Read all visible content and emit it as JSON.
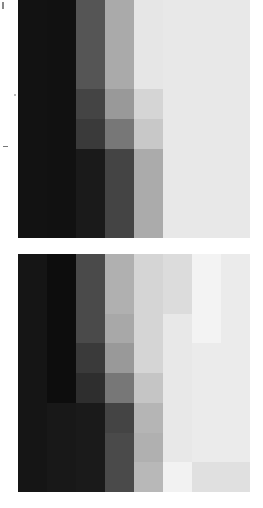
{
  "chart_data": [
    {
      "type": "heatmap",
      "title": "",
      "xlabel": "",
      "ylabel": "",
      "rows": 8,
      "cols": 8,
      "colormap": "grayscale",
      "values": [
        [
          "#121212",
          "#111111",
          "#555555",
          "#aaaaaa",
          "#e6e6e6",
          "#e8e8e8",
          "#e8e8e8",
          "#e8e8e8"
        ],
        [
          "#121212",
          "#111111",
          "#555555",
          "#aaaaaa",
          "#e6e6e6",
          "#e8e8e8",
          "#e8e8e8",
          "#e8e8e8"
        ],
        [
          "#121212",
          "#111111",
          "#555555",
          "#aaaaaa",
          "#e6e6e6",
          "#e8e8e8",
          "#e8e8e8",
          "#e8e8e8"
        ],
        [
          "#121212",
          "#111111",
          "#444444",
          "#999999",
          "#d5d5d5",
          "#e8e8e8",
          "#e8e8e8",
          "#e8e8e8"
        ],
        [
          "#121212",
          "#111111",
          "#3a3a3a",
          "#777777",
          "#c8c8c8",
          "#e8e8e8",
          "#e8e8e8",
          "#e8e8e8"
        ],
        [
          "#121212",
          "#111111",
          "#1a1a1a",
          "#444444",
          "#ababab",
          "#e8e8e8",
          "#e8e8e8",
          "#e8e8e8"
        ],
        [
          "#121212",
          "#111111",
          "#1a1a1a",
          "#444444",
          "#ababab",
          "#e8e8e8",
          "#e8e8e8",
          "#e8e8e8"
        ],
        [
          "#121212",
          "#111111",
          "#1a1a1a",
          "#444444",
          "#ababab",
          "#e8e8e8",
          "#e8e8e8",
          "#e8e8e8"
        ]
      ]
    },
    {
      "type": "heatmap",
      "title": "",
      "xlabel": "",
      "ylabel": "",
      "rows": 8,
      "cols": 8,
      "colormap": "grayscale",
      "values": [
        [
          "#151515",
          "#0d0d0d",
          "#4a4a4a",
          "#b0b0b0",
          "#d5d5d5",
          "#dcdcdc",
          "#f3f3f3",
          "#ebebeb"
        ],
        [
          "#151515",
          "#0d0d0d",
          "#4a4a4a",
          "#b0b0b0",
          "#d5d5d5",
          "#dcdcdc",
          "#f3f3f3",
          "#ebebeb"
        ],
        [
          "#151515",
          "#0d0d0d",
          "#4a4a4a",
          "#a8a8a8",
          "#d5d5d5",
          "#e8e8e8",
          "#f3f3f3",
          "#ebebeb"
        ],
        [
          "#151515",
          "#0d0d0d",
          "#3a3a3a",
          "#999999",
          "#d5d5d5",
          "#e8e8e8",
          "#ebebeb",
          "#ebebeb"
        ],
        [
          "#151515",
          "#0d0d0d",
          "#2e2e2e",
          "#777777",
          "#c5c5c5",
          "#e8e8e8",
          "#ebebeb",
          "#ebebeb"
        ],
        [
          "#151515",
          "#181818",
          "#1a1a1a",
          "#444444",
          "#b5b5b5",
          "#e8e8e8",
          "#ebebeb",
          "#ebebeb"
        ],
        [
          "#151515",
          "#181818",
          "#1a1a1a",
          "#4a4a4a",
          "#b0b0b0",
          "#e8e8e8",
          "#ebebeb",
          "#ebebeb"
        ],
        [
          "#151515",
          "#181818",
          "#1a1a1a",
          "#4a4a4a",
          "#b8b8b8",
          "#f2f2f2",
          "#e0e0e0",
          "#e0e0e0"
        ]
      ]
    }
  ]
}
